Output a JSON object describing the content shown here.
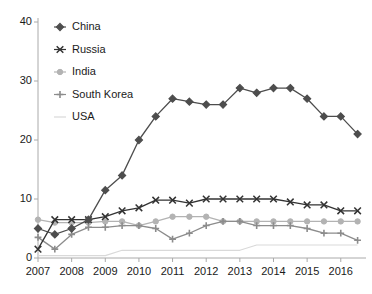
{
  "chart_data": {
    "type": "line",
    "title": "",
    "xlabel": "",
    "ylabel": "",
    "xlim": [
      2007.0,
      2016.75
    ],
    "ylim": [
      0,
      40
    ],
    "yticks": [
      0,
      10,
      20,
      30,
      40
    ],
    "xticks": [
      2007,
      2008,
      2009,
      2010,
      2011,
      2012,
      2013,
      2014,
      2015,
      2016
    ],
    "x": [
      2007,
      2007.5,
      2008,
      2008.5,
      2009,
      2009.5,
      2010,
      2010.5,
      2011,
      2011.5,
      2012,
      2012.5,
      2013,
      2013.5,
      2014,
      2014.5,
      2015,
      2015.5,
      2016,
      2016.5
    ],
    "grid": false,
    "legend_position": "upper-left",
    "series": [
      {
        "name": "China",
        "color": "#4d4d4d",
        "marker": "diamond",
        "values": [
          5.0,
          4.0,
          5.0,
          6.5,
          11.5,
          14.0,
          20.0,
          24.0,
          27.0,
          26.5,
          26.0,
          26.0,
          28.8,
          28.0,
          28.8,
          28.8,
          27.0,
          24.0,
          24.0,
          21.0
        ]
      },
      {
        "name": "Russia",
        "color": "#333333",
        "marker": "x",
        "values": [
          1.5,
          6.5,
          6.5,
          6.5,
          7.0,
          8.0,
          8.5,
          9.8,
          9.8,
          9.3,
          10.0,
          10.0,
          10.0,
          10.0,
          10.0,
          9.5,
          9.0,
          9.0,
          8.0,
          8.0
        ]
      },
      {
        "name": "India",
        "color": "#b3b3b3",
        "marker": "circle",
        "values": [
          6.5,
          6.0,
          6.0,
          6.0,
          6.2,
          6.2,
          5.5,
          6.2,
          7.0,
          7.0,
          7.0,
          6.2,
          6.2,
          6.2,
          6.2,
          6.2,
          6.2,
          6.2,
          6.2,
          6.2
        ]
      },
      {
        "name": "South Korea",
        "color": "#8c8c8c",
        "marker": "plus",
        "values": [
          3.5,
          1.5,
          4.0,
          5.2,
          5.2,
          5.5,
          5.5,
          5.0,
          3.2,
          4.2,
          5.5,
          6.2,
          6.2,
          5.5,
          5.5,
          5.5,
          5.0,
          4.2,
          4.2,
          3.0
        ]
      },
      {
        "name": "USA",
        "color": "#d9d9d9",
        "marker": "none",
        "values": [
          0.4,
          0.4,
          0.4,
          0.4,
          0.4,
          1.3,
          1.3,
          1.3,
          1.3,
          1.3,
          1.3,
          1.3,
          1.3,
          2.2,
          2.2,
          2.2,
          2.2,
          2.2,
          2.2,
          2.2
        ]
      }
    ]
  },
  "axis": {
    "y_labels": [
      "40",
      "30",
      "20",
      "10",
      "0"
    ],
    "x_labels": [
      "2007",
      "2008",
      "2009",
      "2010",
      "2011",
      "2012",
      "2013",
      "2014",
      "2015",
      "2016"
    ]
  },
  "legend": {
    "items": [
      {
        "label": "China"
      },
      {
        "label": "Russia"
      },
      {
        "label": "India"
      },
      {
        "label": "South Korea"
      },
      {
        "label": "USA"
      }
    ]
  }
}
